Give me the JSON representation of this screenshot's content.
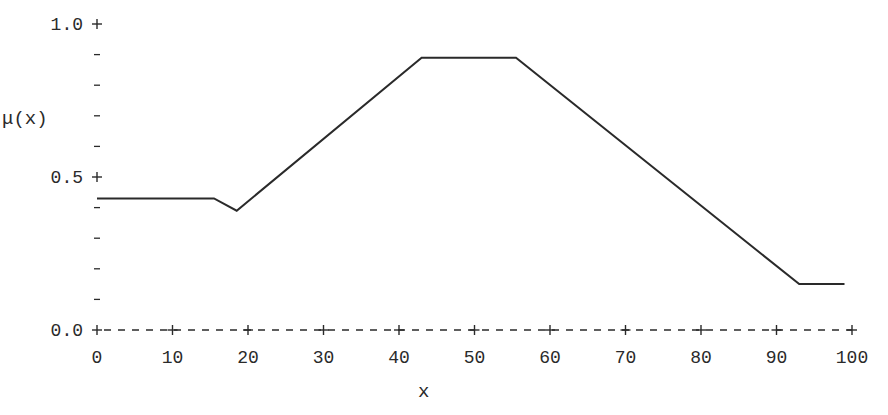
{
  "chart_data": {
    "type": "line",
    "title": "",
    "xlabel": "x",
    "ylabel": "μ(x)",
    "xlim": [
      0,
      100
    ],
    "ylim": [
      0.0,
      1.0
    ],
    "x_ticks": [
      0,
      10,
      20,
      30,
      40,
      50,
      60,
      70,
      80,
      90,
      100
    ],
    "x_tick_labels": [
      "0",
      "10",
      "20",
      "30",
      "40",
      "50",
      "60",
      "70",
      "80",
      "90",
      "100"
    ],
    "y_ticks": [
      0.0,
      0.1,
      0.2,
      0.3,
      0.4,
      0.5,
      0.6,
      0.7,
      0.8,
      0.9,
      1.0
    ],
    "y_tick_labels": [
      "0.0",
      "",
      "",
      "",
      "",
      "0.5",
      "",
      "",
      "",
      "",
      "1.0"
    ],
    "grid": false,
    "legend": null,
    "series": [
      {
        "name": "μ(x)",
        "x": [
          0,
          15.5,
          18.5,
          43,
          55.5,
          93,
          99
        ],
        "y": [
          0.43,
          0.43,
          0.39,
          0.89,
          0.89,
          0.15,
          0.15
        ],
        "color": "#2a2a2a"
      }
    ]
  },
  "axis": {
    "ylabel": "μ(x)",
    "xlabel": "x",
    "y_major_labels": [
      "1.0",
      "0.5",
      "0.0"
    ]
  },
  "colors": {
    "line": "#2a2a2a",
    "background": "#ffffff"
  }
}
